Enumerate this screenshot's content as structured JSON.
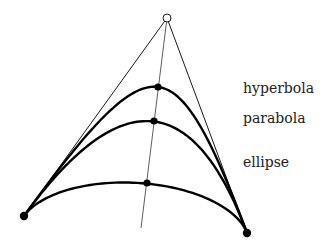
{
  "diagram": {
    "control_point": {
      "x": 167,
      "y": 18,
      "style": "open-circle"
    },
    "endpoints": [
      {
        "x": 24,
        "y": 216
      },
      {
        "x": 247,
        "y": 233
      }
    ],
    "axis_line": {
      "from": {
        "x": 167,
        "y": 18
      },
      "to": {
        "x": 141,
        "y": 228
      }
    },
    "curves": [
      {
        "name": "hyperbola",
        "label": "hyperbola",
        "weight": 2.0,
        "shoulder": {
          "x": 158,
          "y": 87
        },
        "label_pos": {
          "x": 243,
          "y": 91
        }
      },
      {
        "name": "parabola",
        "label": "parabola",
        "weight": 1.0,
        "shoulder": {
          "x": 154,
          "y": 121
        },
        "label_pos": {
          "x": 243,
          "y": 121
        }
      },
      {
        "name": "ellipse",
        "label": "ellipse",
        "weight": 0.25,
        "shoulder": {
          "x": 147,
          "y": 183
        },
        "label_pos": {
          "x": 243,
          "y": 165
        }
      }
    ]
  },
  "colors": {
    "stroke": "#000000",
    "thin_stroke": "#333333",
    "background": "#ffffff"
  }
}
